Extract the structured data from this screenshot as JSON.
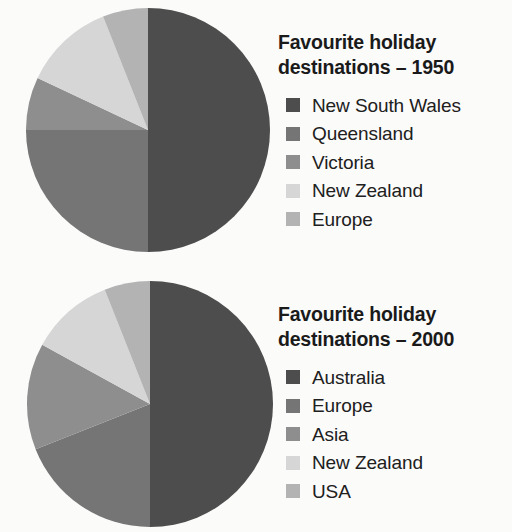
{
  "page": {
    "background_color": "#fbfbfa",
    "text_color": "#1a1a1a"
  },
  "charts": [
    {
      "id": "1950",
      "title": "Favourite holiday\ndestinations – 1950",
      "title_line1": "Favourite holiday",
      "title_line2": "destinations – 1950",
      "legend": [
        {
          "label": "New South Wales",
          "color": "#4d4d4d"
        },
        {
          "label": "Queensland",
          "color": "#757575"
        },
        {
          "label": "Victoria",
          "color": "#8e8e8e"
        },
        {
          "label": "New Zealand",
          "color": "#d6d6d6"
        },
        {
          "label": "Europe",
          "color": "#b3b3b3"
        }
      ]
    },
    {
      "id": "2000",
      "title": "Favourite holiday\ndestinations – 2000",
      "title_line1": "Favourite holiday",
      "title_line2": "destinations – 2000",
      "legend": [
        {
          "label": "Australia",
          "color": "#4d4d4d"
        },
        {
          "label": "Europe",
          "color": "#757575"
        },
        {
          "label": "Asia",
          "color": "#8e8e8e"
        },
        {
          "label": "New Zealand",
          "color": "#d6d6d6"
        },
        {
          "label": "USA",
          "color": "#b3b3b3"
        }
      ]
    }
  ],
  "chart_data": [
    {
      "type": "pie",
      "title": "Favourite holiday destinations – 1950",
      "categories": [
        "New South Wales",
        "Queensland",
        "Victoria",
        "New Zealand",
        "Europe"
      ],
      "values": [
        50,
        25,
        7,
        12,
        6
      ],
      "unit": "percent",
      "colors": [
        "#4d4d4d",
        "#757575",
        "#8e8e8e",
        "#d6d6d6",
        "#b3b3b3"
      ],
      "start_angle_deg": 0,
      "direction": "clockwise",
      "legend_position": "right",
      "grid": false,
      "xlabel": "",
      "ylabel": ""
    },
    {
      "type": "pie",
      "title": "Favourite holiday destinations – 2000",
      "categories": [
        "Australia",
        "Europe",
        "Asia",
        "New Zealand",
        "USA"
      ],
      "values": [
        50,
        19,
        14,
        11,
        6
      ],
      "unit": "percent",
      "colors": [
        "#4d4d4d",
        "#757575",
        "#8e8e8e",
        "#d6d6d6",
        "#b3b3b3"
      ],
      "start_angle_deg": 0,
      "direction": "clockwise",
      "legend_position": "right",
      "grid": false,
      "xlabel": "",
      "ylabel": ""
    }
  ]
}
